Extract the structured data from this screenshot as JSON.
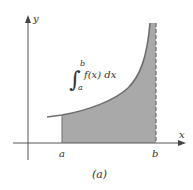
{
  "figure": {
    "caption": "(a)",
    "axes": {
      "x_label": "x",
      "y_label": "y"
    },
    "ticks": {
      "a": "a",
      "b": "b"
    },
    "integral": {
      "symbol": "∫",
      "lower": "a",
      "upper": "b",
      "integrand": "f(x) dx"
    },
    "colors": {
      "axis": "#555555",
      "curve": "#6e6e6e",
      "fill": "#a9a9a9",
      "dashed_asymptote": "#6e6e6e",
      "text": "#333333"
    }
  }
}
